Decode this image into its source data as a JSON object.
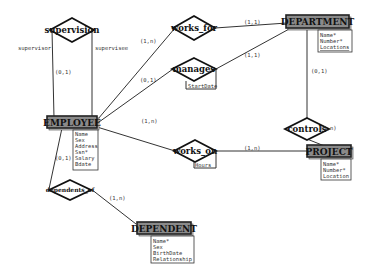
{
  "diagram": {
    "type": "ER diagram",
    "entities": {
      "employee": {
        "name": "EMPLOYEE",
        "attributes": [
          "Name",
          "Sex",
          "Address",
          "Ssn*",
          "Salary",
          "Bdate"
        ]
      },
      "department": {
        "name": "DEPARTMENT",
        "attributes": [
          "Name*",
          "Number*",
          "Locations"
        ]
      },
      "project": {
        "name": "PROJECT",
        "attributes": [
          "Name*",
          "Number*",
          "Location"
        ]
      },
      "dependent": {
        "name": "DEPENDENT",
        "attributes": [
          "Name*",
          "Sex",
          "BirthDate",
          "Relationship"
        ]
      }
    },
    "relationships": {
      "supervision": {
        "name": "supervision",
        "role_left": "supervisor",
        "role_right": "supervisee",
        "card": "(0,1)"
      },
      "works_for": {
        "name": "works_for",
        "card_employee": "(1,n)",
        "card_department": "(1,1)"
      },
      "manages": {
        "name": "manages",
        "attribute": "StartDate",
        "card_employee": "(0,1)",
        "card_department": "(1,1)"
      },
      "controls": {
        "name": "controls",
        "card_department": "(0,1)",
        "card_project": "(1,n)"
      },
      "works_on": {
        "name": "works_on",
        "attribute": "Hours",
        "card_employee": "(1,n)",
        "card_project": "(1,n)"
      },
      "dependents_of": {
        "name": "dependents_of",
        "card_employee": "(0,1)",
        "card_dependent": "(1,n)"
      }
    }
  }
}
